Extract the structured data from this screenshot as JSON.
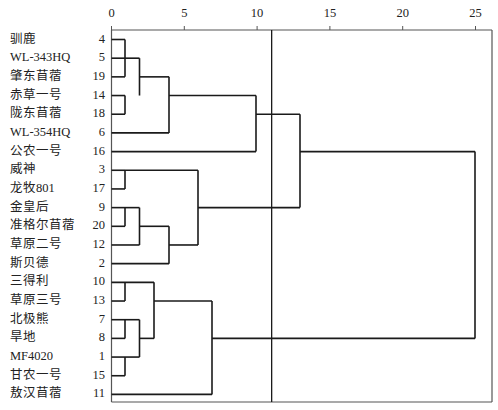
{
  "chart_data": {
    "type": "dendrogram",
    "title": "",
    "xlabel": "",
    "ylabel": "",
    "x_axis": {
      "ticks": [
        0,
        5,
        10,
        15,
        20,
        25
      ],
      "range": [
        0,
        25
      ],
      "position": "top"
    },
    "grid": false,
    "legend": null,
    "reference_line": {
      "x": 11
    },
    "leaves": [
      {
        "name": "驯鹿",
        "id": "4"
      },
      {
        "name": "WL-343HQ",
        "id": "5"
      },
      {
        "name": "肇东苜蓿",
        "id": "19"
      },
      {
        "name": "赤草一号",
        "id": "14"
      },
      {
        "name": "陇东苜蓿",
        "id": "18"
      },
      {
        "name": "WL-354HQ",
        "id": "6"
      },
      {
        "name": "公农一号",
        "id": "16"
      },
      {
        "name": "威神",
        "id": "3"
      },
      {
        "name": "龙牧801",
        "id": "17"
      },
      {
        "name": "金皇后",
        "id": "9"
      },
      {
        "name": "准格尔苜蓿",
        "id": "20"
      },
      {
        "name": "草原二号",
        "id": "12"
      },
      {
        "name": "斯贝德",
        "id": "2"
      },
      {
        "name": "三得利",
        "id": "10"
      },
      {
        "name": "草原三号",
        "id": "13"
      },
      {
        "name": "北极熊",
        "id": "7"
      },
      {
        "name": "旱地",
        "id": "8"
      },
      {
        "name": "MF4020",
        "id": "1"
      },
      {
        "name": "甘农一号",
        "id": "15"
      },
      {
        "name": "敖汉苜蓿",
        "id": "11"
      }
    ],
    "merges": [
      {
        "members": [
          "4",
          "19"
        ],
        "distance": 1,
        "x_from": 0,
        "rows": [
          0,
          2
        ],
        "out_row": 0
      },
      {
        "members": [
          "4,19",
          "5"
        ],
        "distance": 1,
        "rows": [
          0,
          1
        ],
        "out_row": 1,
        "note": "5 joins 4/19 at ~1"
      },
      {
        "members": [
          "14",
          "18"
        ],
        "distance": 1,
        "rows": [
          3,
          4
        ],
        "out_row": 3
      },
      {
        "members": [
          "4,5,19",
          "14,18"
        ],
        "distance": 2,
        "rows": [
          1,
          3
        ],
        "out_row": 2
      },
      {
        "members": [
          "4,5,19,14,18",
          "6"
        ],
        "distance": 4,
        "rows": [
          2,
          5
        ],
        "out_row": 3
      },
      {
        "members": [
          "cluster A",
          "16"
        ],
        "distance": 10,
        "rows": [
          3,
          6
        ],
        "out_row": 4
      },
      {
        "members": [
          "3",
          "17"
        ],
        "distance": 1,
        "rows": [
          7,
          8
        ],
        "out_row": 7
      },
      {
        "members": [
          "9",
          "20"
        ],
        "distance": 1,
        "rows": [
          9,
          10
        ],
        "out_row": 9
      },
      {
        "members": [
          "9,20",
          "12"
        ],
        "distance": 2,
        "rows": [
          9,
          11
        ],
        "out_row": 10
      },
      {
        "members": [
          "9,20,12",
          "2"
        ],
        "distance": 4,
        "rows": [
          10,
          12
        ],
        "out_row": 11
      },
      {
        "members": [
          "3,17",
          "9,20,12,2"
        ],
        "distance": 6,
        "rows": [
          7,
          11
        ],
        "out_row": 9
      },
      {
        "members": [
          "cluster A+16",
          "cluster B"
        ],
        "distance": 13,
        "rows": [
          4,
          9
        ],
        "out_row": 6
      },
      {
        "members": [
          "10",
          "13"
        ],
        "distance": 1,
        "rows": [
          13,
          14
        ],
        "out_row": 13
      },
      {
        "members": [
          "7",
          "8"
        ],
        "distance": 1,
        "rows": [
          15,
          16
        ],
        "out_row": 15
      },
      {
        "members": [
          "1",
          "15"
        ],
        "distance": 1,
        "rows": [
          17,
          18
        ],
        "out_row": 17
      },
      {
        "members": [
          "7,8",
          "1,15"
        ],
        "distance": 2,
        "rows": [
          15,
          17
        ],
        "out_row": 16
      },
      {
        "members": [
          "10,13",
          "7,8,1,15"
        ],
        "distance": 3,
        "rows": [
          13,
          16
        ],
        "out_row": 14
      },
      {
        "members": [
          "10,13,7,8,1,15",
          "11"
        ],
        "distance": 7,
        "rows": [
          14,
          19
        ],
        "out_row": 16
      },
      {
        "members": [
          "top group",
          "bottom group"
        ],
        "distance": 25,
        "rows": [
          6,
          16
        ],
        "out_row": null
      }
    ]
  },
  "colors": {
    "line": "#1a1a1a",
    "frame": "#555555",
    "background": "#ffffff"
  }
}
